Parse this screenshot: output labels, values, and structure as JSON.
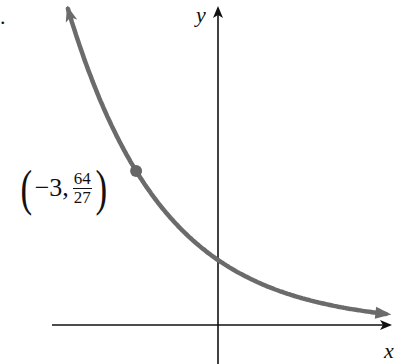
{
  "problem_marker": ".",
  "chart_data": {
    "type": "line",
    "title": "",
    "function": "y = (3/4)^x",
    "xlabel": "x",
    "ylabel": "y",
    "grid": false,
    "ticks": false,
    "legend": null,
    "series": [
      {
        "name": "exponential decay curve",
        "color": "#6b6b6b",
        "x": [
          -5.5,
          -5,
          -4,
          -3,
          -2,
          -1,
          0,
          1,
          2,
          3,
          4,
          5,
          6
        ],
        "y": [
          4.87,
          4.21,
          3.16,
          2.37,
          1.78,
          1.33,
          1.0,
          0.75,
          0.56,
          0.42,
          0.32,
          0.24,
          0.18
        ]
      }
    ],
    "annotations": [
      {
        "x": -3,
        "y": 2.37,
        "label_whole": "−3,",
        "label_num": "64",
        "label_den": "27",
        "marker": "dot"
      }
    ],
    "xlim": [
      -8,
      6.4
    ],
    "ylim": [
      -0.6,
      5
    ]
  },
  "labels": {
    "x_axis": "x",
    "y_axis": "y",
    "point_open": "(",
    "point_x": "−3,",
    "point_num": "64",
    "point_den": "27",
    "point_close": ")"
  },
  "colors": {
    "curve": "#6b6b6b",
    "axes": "#111111",
    "point": "#666666"
  }
}
